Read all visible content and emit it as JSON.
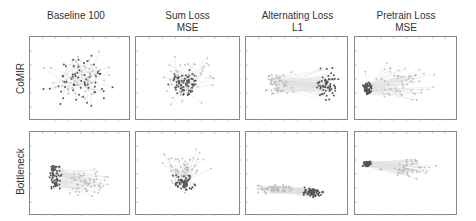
{
  "chart_data": {
    "type": "scatter",
    "layout": "grid 2 rows x 4 columns of small-multiple scatter plots with correspondence lines",
    "columns": [
      {
        "title": "Baseline 100",
        "subtitle": ""
      },
      {
        "title": "Sum Loss",
        "subtitle": "MSE"
      },
      {
        "title": "Alternating Loss",
        "subtitle": "L1"
      },
      {
        "title": "Pretrain Loss",
        "subtitle": "MSE"
      }
    ],
    "rows": [
      {
        "label": "CoMIR"
      },
      {
        "label": "Bottleneck"
      }
    ],
    "grid": false,
    "axis_ticks_labeled": false,
    "series": [
      {
        "name": "dark points",
        "color": "#555555"
      },
      {
        "name": "light points",
        "color": "#bbbbbb"
      },
      {
        "name": "correspondence lines",
        "color": "#dddddd"
      }
    ],
    "panels": [
      {
        "row": "CoMIR",
        "column": "Baseline 100",
        "description": "points scattered in a wide elliptical cloud, light and dark interleaved"
      },
      {
        "row": "CoMIR",
        "column": "Sum Loss MSE",
        "description": "points clustered near center, light and dark overlapping"
      },
      {
        "row": "CoMIR",
        "column": "Alternating Loss L1",
        "description": "light points on left, dark points on right, many horizontal lines between them"
      },
      {
        "row": "CoMIR",
        "column": "Pretrain Loss MSE",
        "description": "dark points dense cluster on left, light points spread to right with fanning lines"
      },
      {
        "row": "Bottleneck",
        "column": "Baseline 100",
        "description": "dark points on left cluster, light points right, converging lines"
      },
      {
        "row": "Bottleneck",
        "column": "Sum Loss MSE",
        "description": "points clustered around lower-center"
      },
      {
        "row": "Bottleneck",
        "column": "Alternating Loss L1",
        "description": "light points stretched along bottom left band, dark points on right"
      },
      {
        "row": "Bottleneck",
        "column": "Pretrain Loss MSE",
        "description": "dense dark cluster upper-left, light points spread right, dark points scattered below"
      }
    ]
  },
  "colors": {
    "dark": "#555555",
    "light": "#bcbcbc",
    "line": "#e0e0e0",
    "border": "#888888"
  }
}
